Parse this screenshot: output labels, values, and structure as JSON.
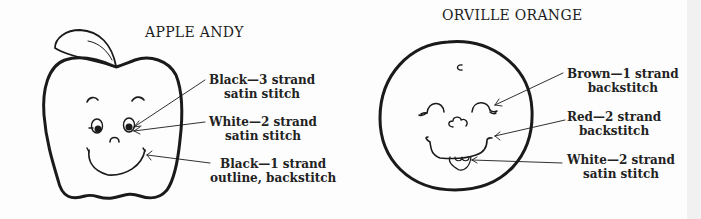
{
  "page": {
    "background": "#fdfdfd",
    "ink": "#1d1d1d"
  },
  "apple": {
    "title": "APPLE ANDY",
    "callouts": [
      {
        "line1": "Black—3 strand",
        "line2": "satin stitch"
      },
      {
        "line1": "White—2 strand",
        "line2": "satin stitch"
      },
      {
        "line1": "Black—1 strand",
        "line2": "outline, backstitch"
      }
    ]
  },
  "orange": {
    "title": "ORVILLE ORANGE",
    "callouts": [
      {
        "line1": "Brown—1 strand",
        "line2": "backstitch"
      },
      {
        "line1": "Red—2 strand",
        "line2": "backstitch"
      },
      {
        "line1": "White—2 strand",
        "line2": "satin stitch"
      }
    ]
  }
}
